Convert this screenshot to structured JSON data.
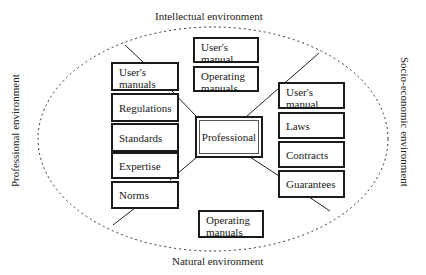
{
  "environments": {
    "top": "Intellectual environment",
    "bottom": "Natural environment",
    "left": "Professional environment",
    "right": "Socio-economic environment"
  },
  "center": {
    "label": "Professional"
  },
  "left_column": [
    {
      "label": "User's manuals"
    },
    {
      "label": "Regulations"
    },
    {
      "label": "Standards"
    },
    {
      "label": "Expertise"
    },
    {
      "label": "Norms"
    }
  ],
  "top_column": [
    {
      "label": "User's manual"
    },
    {
      "label": "Operating manuals"
    }
  ],
  "right_column": [
    {
      "label": "User's manual"
    },
    {
      "label": "Laws"
    },
    {
      "label": "Contracts"
    },
    {
      "label": "Guarantees"
    }
  ],
  "bottom_column": [
    {
      "label": "Operating manuals"
    }
  ],
  "colors": {
    "stroke": "#1a1a1a",
    "background": "#ffffff"
  }
}
